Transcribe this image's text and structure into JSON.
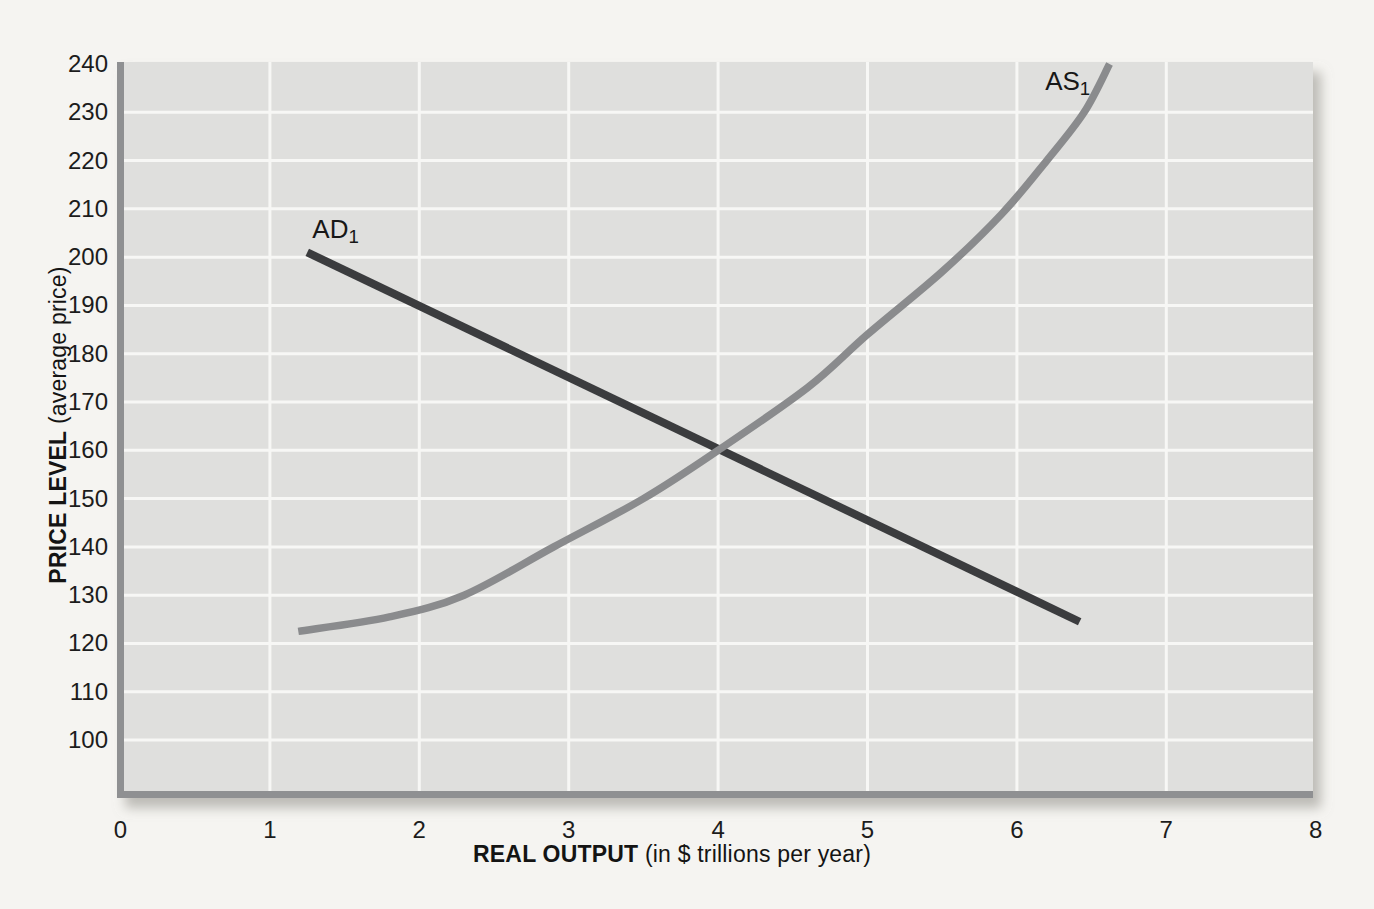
{
  "page": {
    "background": "#f5f4f1"
  },
  "chart_data": {
    "type": "line",
    "title": "",
    "xlabel": {
      "bold": "REAL OUTPUT",
      "rest": " (in $ trillions per year)"
    },
    "ylabel": {
      "bold": "PRICE LEVEL",
      "rest": " (average price)"
    },
    "xlim": [
      0,
      8
    ],
    "ylim": [
      90,
      240
    ],
    "x_ticks": [
      0,
      1,
      2,
      3,
      4,
      5,
      6,
      7,
      8
    ],
    "y_ticks": [
      100,
      110,
      120,
      130,
      140,
      150,
      160,
      170,
      180,
      190,
      200,
      210,
      220,
      230,
      240
    ],
    "grid": true,
    "legend_position": "none",
    "colors": {
      "plot_bg": "#dfdfdd",
      "grid": "#f7f7f5",
      "axis": "#8f9092",
      "text": "#1c1c1c",
      "shadow": "#8f8d85"
    },
    "series": [
      {
        "id": "ad",
        "name": "AD1",
        "label": "AD",
        "label_sub": "1",
        "color": "#3b3c3e",
        "width": 8,
        "smooth": false,
        "points": [
          [
            1.25,
            201
          ],
          [
            6.42,
            124.5
          ]
        ],
        "label_pos": [
          1.44,
          205.5
        ]
      },
      {
        "id": "as",
        "name": "AS1",
        "label": "AS",
        "label_sub": "1",
        "color": "#8a8b8d",
        "width": 7.5,
        "smooth": true,
        "points": [
          [
            1.19,
            122.5
          ],
          [
            1.8,
            125.5
          ],
          [
            2.3,
            130
          ],
          [
            2.9,
            140
          ],
          [
            3.5,
            150
          ],
          [
            4.0,
            160
          ],
          [
            4.6,
            173
          ],
          [
            5.0,
            184
          ],
          [
            5.5,
            197
          ],
          [
            5.9,
            209
          ],
          [
            6.2,
            220
          ],
          [
            6.45,
            230
          ],
          [
            6.62,
            240
          ]
        ],
        "label_pos": [
          6.34,
          236
        ]
      }
    ],
    "intersection": {
      "x": 4,
      "y": 160
    }
  }
}
